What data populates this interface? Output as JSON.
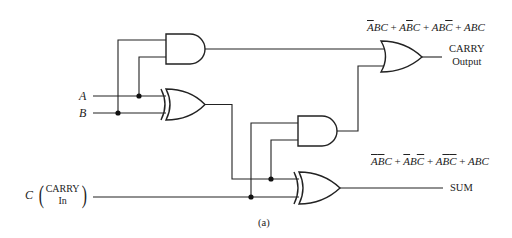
{
  "figure": {
    "caption": "(a)",
    "inputs": {
      "a": {
        "label": "A"
      },
      "b": {
        "label": "B"
      },
      "c": {
        "label": "C",
        "note_line1": "CARRY",
        "note_line2": "In"
      }
    },
    "outputs": {
      "carry": {
        "label_line1": "CARRY",
        "label_line2": "Output",
        "expression": [
          {
            "terms": [
              {
                "v": "A",
                "bar": true
              },
              {
                "v": "B",
                "bar": false
              },
              {
                "v": "C",
                "bar": false
              }
            ]
          },
          {
            "terms": [
              {
                "v": "A",
                "bar": false
              },
              {
                "v": "B",
                "bar": true
              },
              {
                "v": "C",
                "bar": false
              }
            ]
          },
          {
            "terms": [
              {
                "v": "A",
                "bar": false
              },
              {
                "v": "B",
                "bar": false
              },
              {
                "v": "C",
                "bar": true
              }
            ]
          },
          {
            "terms": [
              {
                "v": "A",
                "bar": false
              },
              {
                "v": "B",
                "bar": false
              },
              {
                "v": "C",
                "bar": false
              }
            ]
          }
        ],
        "expression_text": "A̅BC + AB̅C + ABC̅ + ABC"
      },
      "sum": {
        "label": "SUM",
        "expression": [
          {
            "terms": [
              {
                "v": "A",
                "bar": true
              },
              {
                "v": "B",
                "bar": true
              },
              {
                "v": "C",
                "bar": false
              }
            ]
          },
          {
            "terms": [
              {
                "v": "A",
                "bar": true
              },
              {
                "v": "B",
                "bar": false
              },
              {
                "v": "C",
                "bar": true
              }
            ]
          },
          {
            "terms": [
              {
                "v": "A",
                "bar": false
              },
              {
                "v": "B",
                "bar": true
              },
              {
                "v": "C",
                "bar": true
              }
            ]
          },
          {
            "terms": [
              {
                "v": "A",
                "bar": false
              },
              {
                "v": "B",
                "bar": false
              },
              {
                "v": "C",
                "bar": false
              }
            ]
          }
        ],
        "expression_text": "A̅B̅C + A̅BC̅ + AB̅C̅ + ABC"
      }
    },
    "gates": [
      {
        "id": "and1",
        "type": "AND",
        "inputs": [
          "A",
          "B"
        ]
      },
      {
        "id": "xor1",
        "type": "XOR",
        "inputs": [
          "A",
          "B"
        ]
      },
      {
        "id": "and2",
        "type": "AND",
        "inputs": [
          "C",
          "xor1"
        ]
      },
      {
        "id": "xor2",
        "type": "XOR",
        "inputs": [
          "xor1",
          "C"
        ]
      },
      {
        "id": "or1",
        "type": "OR",
        "inputs": [
          "and1",
          "and2"
        ]
      }
    ],
    "symbols": {
      "plus": "+"
    }
  }
}
